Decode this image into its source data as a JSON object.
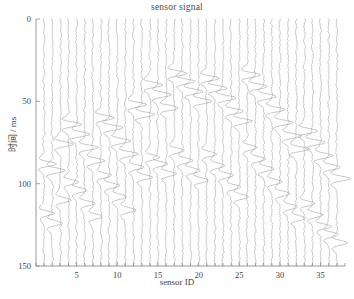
{
  "chart_data": {
    "type": "line",
    "title": "sensor signal",
    "xlabel": "sensor ID",
    "ylabel": "时间 / ms",
    "xlim": [
      0,
      38
    ],
    "ylim": [
      0,
      150
    ],
    "y_inverted": true,
    "grid": false,
    "legend": "none",
    "xticks": [
      5,
      10,
      15,
      20,
      25,
      30,
      35
    ],
    "xtick_labels": [
      "5",
      "10",
      "15",
      "20",
      "25",
      "30",
      "35"
    ],
    "xminor_step": 1,
    "yticks": [
      0,
      50,
      100,
      150
    ],
    "ytick_labels": [
      "0",
      "50",
      "100",
      "150"
    ],
    "trace_color": "#9a9a9a",
    "axis_color": "#8e8e8e",
    "n_traces": 37,
    "trace_ids": [
      1,
      2,
      3,
      4,
      5,
      6,
      7,
      8,
      9,
      10,
      11,
      12,
      13,
      14,
      15,
      16,
      17,
      18,
      19,
      20,
      21,
      22,
      23,
      24,
      25,
      26,
      27,
      28,
      29,
      30,
      31,
      32,
      33,
      34,
      35,
      36,
      37
    ],
    "time_start_ms": 0,
    "time_end_ms": 150,
    "noise_amplitude_traces": 0.12,
    "pulse_amplitude_traces": 1.6,
    "pulse_width_ms": 9,
    "series": [
      {
        "name": "sensor 1",
        "arrivals_ms": [
          88,
          118
        ]
      },
      {
        "name": "sensor 2",
        "arrivals_ms": [
          92,
          124
        ]
      },
      {
        "name": "sensor 3",
        "arrivals_ms": [
          76,
          110
        ]
      },
      {
        "name": "sensor 4",
        "arrivals_ms": [
          64,
          99
        ]
      },
      {
        "name": "sensor 5",
        "arrivals_ms": [
          70,
          104
        ]
      },
      {
        "name": "sensor 6",
        "arrivals_ms": [
          78,
          112
        ]
      },
      {
        "name": "sensor 7",
        "arrivals_ms": [
          86,
          120
        ]
      },
      {
        "name": "sensor 8",
        "arrivals_ms": [
          60,
          95
        ]
      },
      {
        "name": "sensor 9",
        "arrivals_ms": [
          66,
          101
        ]
      },
      {
        "name": "sensor 10",
        "arrivals_ms": [
          74,
          108
        ]
      },
      {
        "name": "sensor 11",
        "arrivals_ms": [
          82,
          116
        ]
      },
      {
        "name": "sensor 12",
        "arrivals_ms": [
          52,
          90
        ]
      },
      {
        "name": "sensor 13",
        "arrivals_ms": [
          58,
          96
        ]
      },
      {
        "name": "sensor 14",
        "arrivals_ms": [
          40,
          84
        ]
      },
      {
        "name": "sensor 15",
        "arrivals_ms": [
          46,
          88
        ]
      },
      {
        "name": "sensor 16",
        "arrivals_ms": [
          54,
          94
        ]
      },
      {
        "name": "sensor 17",
        "arrivals_ms": [
          33,
          80
        ]
      },
      {
        "name": "sensor 18",
        "arrivals_ms": [
          38,
          86
        ]
      },
      {
        "name": "sensor 19",
        "arrivals_ms": [
          44,
          92
        ]
      },
      {
        "name": "sensor 20",
        "arrivals_ms": [
          50,
          98
        ]
      },
      {
        "name": "sensor 21",
        "arrivals_ms": [
          36,
          82
        ]
      },
      {
        "name": "sensor 22",
        "arrivals_ms": [
          42,
          89
        ]
      },
      {
        "name": "sensor 23",
        "arrivals_ms": [
          48,
          95
        ]
      },
      {
        "name": "sensor 24",
        "arrivals_ms": [
          56,
          102
        ]
      },
      {
        "name": "sensor 25",
        "arrivals_ms": [
          62,
          108
        ]
      },
      {
        "name": "sensor 26",
        "arrivals_ms": [
          34,
          78
        ]
      },
      {
        "name": "sensor 27",
        "arrivals_ms": [
          41,
          85
        ]
      },
      {
        "name": "sensor 28",
        "arrivals_ms": [
          47,
          91
        ]
      },
      {
        "name": "sensor 29",
        "arrivals_ms": [
          55,
          99
        ]
      },
      {
        "name": "sensor 30",
        "arrivals_ms": [
          63,
          106
        ]
      },
      {
        "name": "sensor 31",
        "arrivals_ms": [
          71,
          114
        ]
      },
      {
        "name": "sensor 32",
        "arrivals_ms": [
          79,
          121
        ]
      },
      {
        "name": "sensor 33",
        "arrivals_ms": [
          68,
          112
        ]
      },
      {
        "name": "sensor 34",
        "arrivals_ms": [
          75,
          119
        ]
      },
      {
        "name": "sensor 35",
        "arrivals_ms": [
          83,
          126
        ]
      },
      {
        "name": "sensor 36",
        "arrivals_ms": [
          90,
          131
        ]
      },
      {
        "name": "sensor 37",
        "arrivals_ms": [
          97,
          136
        ]
      }
    ]
  }
}
